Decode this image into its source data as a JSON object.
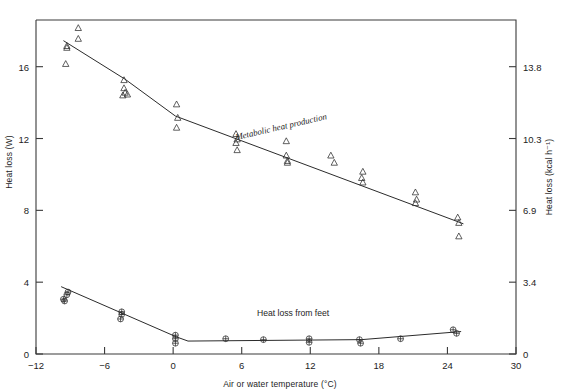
{
  "chart_data": {
    "type": "scatter",
    "title": "",
    "xlabel": "Air or water temperature (°C)",
    "ylabel": "Heat loss (W)",
    "ylabel_right": "Heat loss (kcal h⁻¹)",
    "xlim": [
      -12,
      30
    ],
    "ylim": [
      0,
      18.6
    ],
    "ylim_right": [
      0,
      16.0
    ],
    "grid": false,
    "legend": "inline-annotations",
    "xticks": [
      -12,
      -6,
      0,
      6,
      12,
      18,
      24,
      30
    ],
    "xtick_labels": [
      "-12",
      "-6",
      "0",
      "6",
      "12",
      "18",
      "24",
      "30"
    ],
    "yticks": [
      0,
      4,
      8,
      12,
      16
    ],
    "ytick_labels": [
      "0",
      "4",
      "8",
      "12",
      "16"
    ],
    "yticks_right": [
      0,
      3.4,
      6.9,
      10.3,
      13.8
    ],
    "ytick_labels_right": [
      "0",
      "3.4",
      "6.9",
      "10.3",
      "13.8"
    ],
    "annotations": [
      {
        "text": "Metabolic heat production",
        "x": 9.5,
        "y": 12.5,
        "rotation": -13
      },
      {
        "text": "Heat loss from feet",
        "x": 10.5,
        "y": 2.1,
        "rotation": 0
      }
    ],
    "series": [
      {
        "name": "Metabolic heat production",
        "marker": "triangle",
        "fit_line": [
          {
            "x": -9.6,
            "y": 17.45
          },
          {
            "x": -4.2,
            "y": 15.3
          },
          {
            "x": 0.2,
            "y": 13.25
          },
          {
            "x": 25.4,
            "y": 7.25
          }
        ],
        "points": [
          {
            "x": -9.3,
            "y": 17.05
          },
          {
            "x": -9.3,
            "y": 17.15
          },
          {
            "x": -9.4,
            "y": 16.15
          },
          {
            "x": -8.3,
            "y": 18.15
          },
          {
            "x": -8.3,
            "y": 17.55
          },
          {
            "x": -4.3,
            "y": 15.25
          },
          {
            "x": -4.3,
            "y": 14.8
          },
          {
            "x": -4.2,
            "y": 14.55
          },
          {
            "x": -4.0,
            "y": 14.45
          },
          {
            "x": -4.4,
            "y": 14.4
          },
          {
            "x": 0.3,
            "y": 13.9
          },
          {
            "x": 0.4,
            "y": 13.15
          },
          {
            "x": 0.3,
            "y": 12.6
          },
          {
            "x": 5.5,
            "y": 12.25
          },
          {
            "x": 5.6,
            "y": 11.95
          },
          {
            "x": 5.5,
            "y": 11.75
          },
          {
            "x": 5.6,
            "y": 11.35
          },
          {
            "x": 9.9,
            "y": 11.85
          },
          {
            "x": 9.9,
            "y": 11.05
          },
          {
            "x": 10.0,
            "y": 10.75
          },
          {
            "x": 10.0,
            "y": 10.65
          },
          {
            "x": 13.8,
            "y": 11.05
          },
          {
            "x": 14.1,
            "y": 10.65
          },
          {
            "x": 16.6,
            "y": 10.15
          },
          {
            "x": 16.5,
            "y": 9.8
          },
          {
            "x": 16.6,
            "y": 9.55
          },
          {
            "x": 21.2,
            "y": 9.0
          },
          {
            "x": 21.3,
            "y": 8.6
          },
          {
            "x": 21.2,
            "y": 8.4
          },
          {
            "x": 24.9,
            "y": 7.6
          },
          {
            "x": 25.0,
            "y": 7.3
          },
          {
            "x": 25.0,
            "y": 6.55
          }
        ]
      },
      {
        "name": "Heat loss from feet",
        "marker": "crossed-circle",
        "fit_line": [
          {
            "x": -9.8,
            "y": 3.75
          },
          {
            "x": 0.3,
            "y": 0.95
          },
          {
            "x": 1.3,
            "y": 0.72
          },
          {
            "x": 16.5,
            "y": 0.8
          },
          {
            "x": 25.2,
            "y": 1.25
          }
        ],
        "points": [
          {
            "x": -9.2,
            "y": 3.45
          },
          {
            "x": -9.3,
            "y": 3.3
          },
          {
            "x": -9.6,
            "y": 3.05
          },
          {
            "x": -9.5,
            "y": 2.95
          },
          {
            "x": -4.5,
            "y": 2.35
          },
          {
            "x": -4.5,
            "y": 2.2
          },
          {
            "x": -4.6,
            "y": 1.95
          },
          {
            "x": 0.2,
            "y": 1.05
          },
          {
            "x": 0.2,
            "y": 0.85
          },
          {
            "x": 0.2,
            "y": 0.6
          },
          {
            "x": 4.6,
            "y": 0.85
          },
          {
            "x": 7.9,
            "y": 0.8
          },
          {
            "x": 11.9,
            "y": 0.85
          },
          {
            "x": 11.9,
            "y": 0.65
          },
          {
            "x": 16.3,
            "y": 0.8
          },
          {
            "x": 16.4,
            "y": 0.6
          },
          {
            "x": 19.9,
            "y": 0.85
          },
          {
            "x": 24.5,
            "y": 1.35
          },
          {
            "x": 24.8,
            "y": 1.15
          }
        ]
      }
    ]
  }
}
